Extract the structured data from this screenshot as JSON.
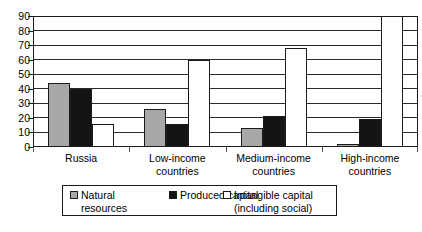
{
  "chart_data": {
    "type": "bar",
    "title": "",
    "subtitle": "",
    "xlabel": "",
    "ylabel": "",
    "ylim": [
      0,
      90
    ],
    "ytick_step": 10,
    "yticks": [
      90,
      80,
      70,
      60,
      50,
      40,
      30,
      20,
      10,
      0
    ],
    "grid": true,
    "legend_position": "bottom",
    "categories": [
      "Russia",
      "Low-income\ncountries",
      "Medium-income\ncountries",
      "High-income\ncountries"
    ],
    "series": [
      {
        "name": "Natural resources",
        "legend_label": "Natural\nresources",
        "color": "#a8a8a8",
        "swatch": "natural",
        "values": [
          44,
          26,
          13,
          2
        ]
      },
      {
        "name": "Produced capital",
        "legend_label": "Produced capital",
        "color": "#141414",
        "swatch": "produced",
        "values": [
          40,
          16,
          21,
          19
        ]
      },
      {
        "name": "Intangible capital (including social)",
        "legend_label": "Intangible capital\n(including social)",
        "color": "#ffffff",
        "swatch": "intangible",
        "values": [
          16,
          60,
          68,
          95
        ]
      }
    ]
  },
  "colors": {
    "natural": "#a8a8a8",
    "produced": "#141414",
    "intangible": "#ffffff",
    "axis": "#1a1a1a",
    "grid": "#2a2a2a",
    "background": "#ffffff"
  }
}
